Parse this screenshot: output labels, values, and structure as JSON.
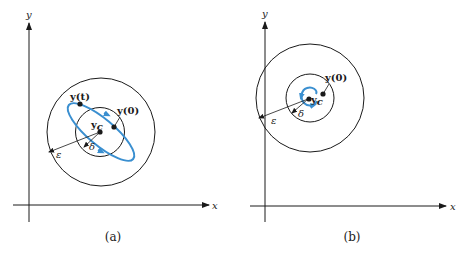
{
  "colors": {
    "ink": "#1a1a1a",
    "trajectory": "#3a8fd0",
    "background": "#ffffff"
  },
  "panels": [
    {
      "id": "a",
      "caption": "(a)",
      "x_axis_label": "x",
      "y_axis_label": "y",
      "equilibrium_label": "y",
      "equilibrium_subscript": "c",
      "initial_label": "y(0)",
      "current_label": "y(t)",
      "delta_label": "δ",
      "epsilon_label": "ε",
      "trajectory_type": "closed orbit (ellipse) — stable"
    },
    {
      "id": "b",
      "caption": "(b)",
      "x_axis_label": "x",
      "y_axis_label": "y",
      "equilibrium_label": "y",
      "equilibrium_subscript": "c",
      "initial_label": "y(0)",
      "delta_label": "δ",
      "epsilon_label": "ε",
      "trajectory_type": "inward spiral — asymptotically stable"
    }
  ]
}
